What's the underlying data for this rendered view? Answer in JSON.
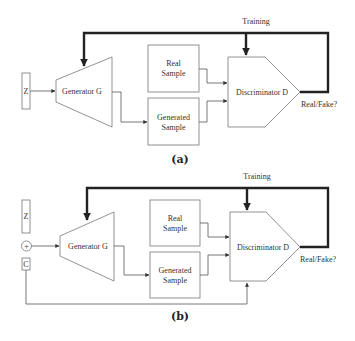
{
  "panels": [
    {
      "id": "a",
      "caption": "(a)",
      "training_label": "Training",
      "input_z": "Z",
      "generator": "Generator G",
      "real_sample": [
        "Real",
        "Sample"
      ],
      "generated_sample": [
        "Generated",
        "Sample"
      ],
      "discriminator": "Discriminator D",
      "output": "Real/Fake?"
    },
    {
      "id": "b",
      "caption": "(b)",
      "training_label": "Training",
      "input_z": "Z",
      "concat_symbol": "+",
      "input_c": "C",
      "generator": "Generator G",
      "real_sample": [
        "Real",
        "Sample"
      ],
      "generated_sample": [
        "Generated",
        "Sample"
      ],
      "discriminator": "Discriminator D",
      "output": "Real/Fake?"
    }
  ],
  "colors": {
    "thick_line": "#222222",
    "thin_line": "#555555",
    "shape_stroke": "#777777"
  }
}
